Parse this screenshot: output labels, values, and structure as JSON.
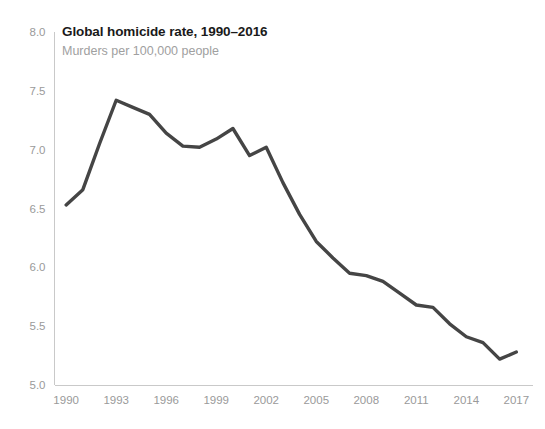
{
  "chart_data": {
    "type": "line",
    "title": "Global homicide rate, 1990–2016",
    "subtitle": "Murders per 100,000 people",
    "xlabel": "",
    "ylabel": "",
    "xlim": [
      1989.3,
      2018.0
    ],
    "ylim": [
      5.0,
      8.0
    ],
    "y_ticks": [
      "5.0",
      "5.5",
      "6.0",
      "6.5",
      "7.0",
      "7.5",
      "8.0"
    ],
    "y_tick_values": [
      5.0,
      5.5,
      6.0,
      6.5,
      7.0,
      7.5,
      8.0
    ],
    "x_ticks": [
      "1990",
      "1993",
      "1996",
      "1999",
      "2002",
      "2005",
      "2008",
      "2011",
      "2014",
      "2017"
    ],
    "x_tick_values": [
      1990,
      1993,
      1996,
      1999,
      2002,
      2005,
      2008,
      2011,
      2014,
      2017
    ],
    "grid": false,
    "legend": false,
    "line_color": "#454545",
    "axis_color": "#c9c9c9",
    "tick_label_color": "#9a9a9a",
    "series": [
      {
        "name": "Global homicide rate",
        "x": [
          1990,
          1991,
          1992,
          1993,
          1994,
          1995,
          1996,
          1997,
          1998,
          1999,
          2000,
          2001,
          2002,
          2003,
          2004,
          2005,
          2006,
          2007,
          2008,
          2009,
          2010,
          2011,
          2012,
          2013,
          2014,
          2015,
          2016,
          2017
        ],
        "values": [
          6.53,
          6.66,
          7.05,
          7.42,
          7.36,
          7.3,
          7.14,
          7.03,
          7.02,
          7.09,
          7.18,
          6.95,
          7.02,
          6.72,
          6.45,
          6.22,
          6.08,
          5.95,
          5.93,
          5.88,
          5.78,
          5.68,
          5.66,
          5.52,
          5.41,
          5.36,
          5.22,
          5.28
        ]
      }
    ]
  }
}
